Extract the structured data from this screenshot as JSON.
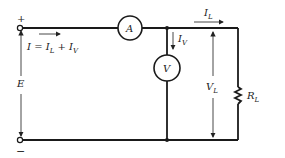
{
  "diagram": {
    "type": "circuit",
    "terminals": {
      "plus": "+",
      "minus": "−"
    },
    "source_label": "E",
    "current_total_label": {
      "I": "I",
      "eq": " = ",
      "IL": "I",
      "IL_sub": "L",
      "plus": " + ",
      "IV": "I",
      "IV_sub": "V"
    },
    "ammeter_label": "A",
    "voltmeter_label": "V",
    "load_current_label": {
      "main": "I",
      "sub": "L"
    },
    "voltmeter_current_label": {
      "main": "I",
      "sub": "V"
    },
    "load_voltage_label": {
      "main": "V",
      "sub": "L"
    },
    "resistor_label": {
      "main": "R",
      "sub": "L"
    },
    "colors": {
      "line": "#1a1a1a",
      "background": "#ffffff"
    }
  }
}
